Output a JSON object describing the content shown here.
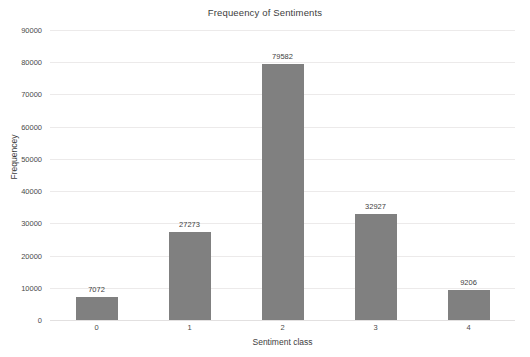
{
  "chart_data": {
    "type": "bar",
    "title": "Frequeency of Sentiments",
    "xlabel": "Sentiment class",
    "ylabel": "Frequencey",
    "categories": [
      "0",
      "1",
      "2",
      "3",
      "4"
    ],
    "values": [
      7072,
      27273,
      79582,
      32927,
      9206
    ],
    "data_labels": [
      "7072",
      "27273",
      "79582",
      "32927",
      "9206"
    ],
    "ylim": [
      0,
      90000
    ],
    "ytick_values": [
      0,
      10000,
      20000,
      30000,
      40000,
      50000,
      60000,
      70000,
      80000,
      90000
    ],
    "ytick_labels": [
      "0",
      "10000",
      "20000",
      "30000",
      "40000",
      "50000",
      "60000",
      "70000",
      "80000",
      "90000"
    ],
    "grid": true,
    "grid_axis": "y",
    "legend": false,
    "bar_color": "#808080",
    "grid_color": "#eceaea",
    "background_color": "#ffffff",
    "text_color": "#3d3d3d"
  }
}
